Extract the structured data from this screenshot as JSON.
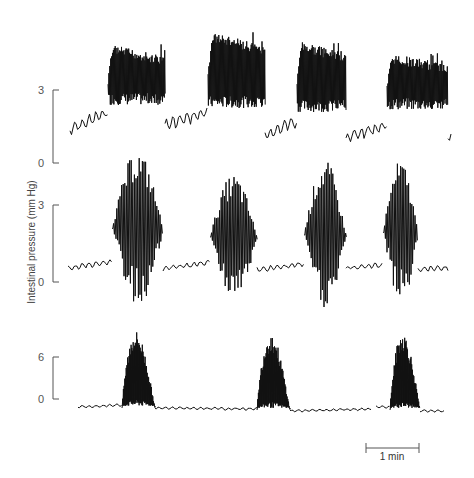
{
  "chart_data": {
    "type": "line",
    "title": "",
    "ylabel": "Intestinal pressure (mm Hg)",
    "xlabel": "",
    "scale_bar": {
      "label": "1 min",
      "x1": 365,
      "x2": 419,
      "y": 448
    },
    "panels": [
      {
        "name": "trace-1",
        "y_ticks": [
          {
            "value": "3",
            "y": 90
          },
          {
            "value": "0",
            "y": 163
          }
        ],
        "bracket_x": 53,
        "baseline_y": 128,
        "unit_px": 24.3,
        "bursts": [
          {
            "start": 108,
            "end": 165,
            "top": 44,
            "bottom": 105,
            "style": "dense"
          },
          {
            "start": 208,
            "end": 265,
            "top": 31,
            "bottom": 108,
            "style": "dense"
          },
          {
            "start": 297,
            "end": 346,
            "top": 40,
            "bottom": 112,
            "style": "dense"
          },
          {
            "start": 387,
            "end": 448,
            "top": 53,
            "bottom": 110,
            "style": "dense"
          }
        ],
        "baseline_segments": [
          {
            "x1": 70,
            "x2": 108,
            "y_start": 130,
            "y_end": 112
          },
          {
            "x1": 165,
            "x2": 208,
            "y_start": 125,
            "y_end": 112
          },
          {
            "x1": 265,
            "x2": 297,
            "y_start": 136,
            "y_end": 120
          },
          {
            "x1": 346,
            "x2": 387,
            "y_start": 138,
            "y_end": 125
          },
          {
            "x1": 448,
            "x2": 452,
            "y_start": 136,
            "y_end": 136
          }
        ]
      },
      {
        "name": "trace-2",
        "y_ticks": [
          {
            "value": "3",
            "y": 205
          },
          {
            "value": "0",
            "y": 282
          }
        ],
        "bracket_x": 53,
        "baseline_y": 269,
        "unit_px": 25.7,
        "bursts": [
          {
            "start": 112,
            "end": 163,
            "top": 150,
            "bottom": 307,
            "style": "oscillation"
          },
          {
            "start": 210,
            "end": 257,
            "top": 174,
            "bottom": 300,
            "style": "oscillation"
          },
          {
            "start": 304,
            "end": 346,
            "top": 160,
            "bottom": 310,
            "style": "oscillation"
          },
          {
            "start": 383,
            "end": 418,
            "top": 160,
            "bottom": 305,
            "style": "oscillation"
          }
        ],
        "baseline_segments": [
          {
            "x1": 68,
            "x2": 112,
            "y_start": 268,
            "y_end": 262
          },
          {
            "x1": 163,
            "x2": 210,
            "y_start": 269,
            "y_end": 262
          },
          {
            "x1": 257,
            "x2": 304,
            "y_start": 270,
            "y_end": 264
          },
          {
            "x1": 346,
            "x2": 383,
            "y_start": 268,
            "y_end": 265
          },
          {
            "x1": 418,
            "x2": 448,
            "y_start": 269,
            "y_end": 268
          }
        ]
      },
      {
        "name": "trace-3",
        "y_ticks": [
          {
            "value": "6",
            "y": 357
          },
          {
            "value": "0",
            "y": 399
          }
        ],
        "bracket_x": 53,
        "baseline_y": 408,
        "unit_px": 7.0,
        "bursts": [
          {
            "start": 122,
            "end": 155,
            "top": 331,
            "bottom": 408,
            "style": "filled"
          },
          {
            "start": 257,
            "end": 290,
            "top": 333,
            "bottom": 410,
            "style": "filled"
          },
          {
            "start": 390,
            "end": 420,
            "top": 332,
            "bottom": 410,
            "style": "filled"
          }
        ],
        "baseline_segments": [
          {
            "x1": 78,
            "x2": 122,
            "y_start": 407,
            "y_end": 405
          },
          {
            "x1": 155,
            "x2": 257,
            "y_start": 408,
            "y_end": 409
          },
          {
            "x1": 290,
            "x2": 372,
            "y_start": 411,
            "y_end": 409
          },
          {
            "x1": 376,
            "x2": 390,
            "y_start": 407,
            "y_end": 407
          },
          {
            "x1": 420,
            "x2": 444,
            "y_start": 411,
            "y_end": 411
          }
        ]
      }
    ]
  }
}
